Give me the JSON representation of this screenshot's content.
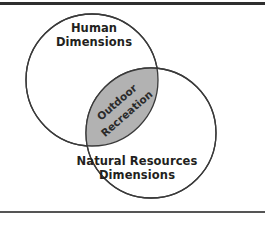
{
  "figure": {
    "type": "venn-diagram",
    "set_count": 2,
    "sets": [
      {
        "id": "human-dimensions",
        "label_lines": [
          "Human",
          "Dimensions"
        ],
        "line1": "Human",
        "line2": "Dimensions",
        "fill": "#ffffff",
        "stroke": "#3a3a3a"
      },
      {
        "id": "natural-resources-dimensions",
        "label_lines": [
          "Natural Resources",
          "Dimensions"
        ],
        "line1": "Natural Resources",
        "line2": "Dimensions",
        "fill": "#ffffff",
        "stroke": "#3a3a3a"
      }
    ],
    "intersection": {
      "id": "outdoor-recreation",
      "label_lines": [
        "Outdoor",
        "Recreation"
      ],
      "line1": "Outdoor",
      "line2": "Recreation",
      "fill": "#b2b2b2",
      "stroke": "#3a3a3a",
      "text_rotation_deg": -41
    },
    "rules": {
      "top_color": "#2f2f2f",
      "bottom_color": "#555555"
    },
    "background": "#ffffff"
  }
}
